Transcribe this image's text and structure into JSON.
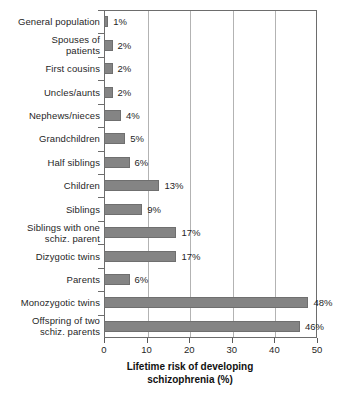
{
  "chart_data": {
    "type": "bar",
    "orientation": "horizontal",
    "title": "",
    "subtitle": "",
    "xlabel": "Lifetime risk of developing\nschizophrenia (%)",
    "ylabel": "",
    "xlim": [
      0,
      50
    ],
    "xticks": [
      0,
      10,
      20,
      30,
      40,
      50
    ],
    "xtick_labels": [
      "0",
      "10",
      "20",
      "30",
      "40",
      "50"
    ],
    "grid": "vertical",
    "legend": null,
    "unit": "%",
    "bar_color": "#848484",
    "bar_edge_color": "#6f6f6f",
    "grid_color": "#b3b3b3",
    "axis_color": "#6d6d6d",
    "categories": [
      "General population",
      "Spouses of\npatients",
      "First cousins",
      "Uncles/aunts",
      "Nephews/nieces",
      "Grandchildren",
      "Half siblings",
      "Children",
      "Siblings",
      "Siblings with one\nschiz. parent",
      "Dizygotic twins",
      "Parents",
      "Monozygotic twins",
      "Offspring of two\nschiz. parents"
    ],
    "values": [
      1,
      2,
      2,
      2,
      4,
      5,
      6,
      13,
      9,
      17,
      17,
      6,
      48,
      46
    ],
    "value_labels": [
      "1%",
      "2%",
      "2%",
      "2%",
      "4%",
      "5%",
      "6%",
      "13%",
      "9%",
      "17%",
      "17%",
      "6%",
      "48%",
      "46%"
    ]
  }
}
